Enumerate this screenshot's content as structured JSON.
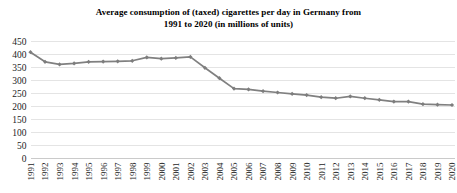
{
  "chart_data": {
    "type": "line",
    "title": "Average consumption of (taxed) cigarettes per day in Germany from 1991 to 2020 (in millions of units)",
    "title_lines": [
      "Average consumption of (taxed) cigarettes per day in Germany from",
      "1991 to 2020 (in millions of units)"
    ],
    "xlabel": "",
    "ylabel": "",
    "ylim": [
      0,
      450
    ],
    "ytick_step": 50,
    "yticks": [
      450,
      400,
      350,
      300,
      250,
      200,
      150,
      100,
      50,
      0
    ],
    "ytick_labels": [
      "450",
      "400",
      "350",
      "300",
      "250",
      "200",
      "150",
      "100",
      "50",
      "0"
    ],
    "grid": true,
    "legend": false,
    "legend_position": "none",
    "categories": [
      "1991",
      "1992",
      "1993",
      "1994",
      "1995",
      "1996",
      "1997",
      "1998",
      "1999",
      "2000",
      "2001",
      "2002",
      "2003",
      "2004",
      "2005",
      "2006",
      "2007",
      "2008",
      "2009",
      "2010",
      "2011",
      "2012",
      "2013",
      "2014",
      "2015",
      "2016",
      "2017",
      "2018",
      "2019",
      "2020"
    ],
    "values": [
      405,
      368,
      358,
      362,
      368,
      369,
      370,
      372,
      385,
      380,
      383,
      387,
      345,
      305,
      265,
      262,
      255,
      250,
      245,
      240,
      232,
      228,
      235,
      228,
      222,
      215,
      215,
      205,
      203,
      202
    ],
    "series": [
      {
        "name": "Average daily consumption",
        "color": "#808080",
        "values": [
          405,
          368,
          358,
          362,
          368,
          369,
          370,
          372,
          385,
          380,
          383,
          387,
          345,
          305,
          265,
          262,
          255,
          250,
          245,
          240,
          232,
          228,
          235,
          228,
          222,
          215,
          215,
          205,
          203,
          202
        ]
      }
    ]
  },
  "style": {
    "line_color": "#808080",
    "marker_color": "#7d7d7d",
    "grid_color": "#d9d9d9",
    "text_color": "#1c1c1c",
    "background": "#ffffff"
  }
}
